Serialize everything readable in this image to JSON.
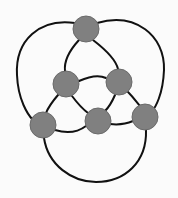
{
  "diagram": {
    "type": "graph",
    "width": 178,
    "height": 198,
    "colors": {
      "background": "#fbfbfb",
      "edge": "#111111",
      "node_fill": "#808080",
      "node_stroke": "#6a6a6a"
    },
    "node_radius": 13,
    "nodes": [
      {
        "id": "top",
        "x": 86,
        "y": 29
      },
      {
        "id": "mid-left",
        "x": 66,
        "y": 84
      },
      {
        "id": "mid-right",
        "x": 119,
        "y": 82
      },
      {
        "id": "bottom-left",
        "x": 43,
        "y": 125
      },
      {
        "id": "bottom-center",
        "x": 98,
        "y": 121
      },
      {
        "id": "bottom-right",
        "x": 145,
        "y": 117
      }
    ],
    "edges": [
      {
        "from": "top",
        "to": "bottom-left",
        "path": "M 75 23 C 40 18, 15 40, 17 75 C 18 100, 28 115, 33 120"
      },
      {
        "from": "top",
        "to": "bottom-right",
        "path": "M 97 23 C 135 12, 165 35, 164 70 C 163 95, 155 108, 152 111"
      },
      {
        "from": "top",
        "to": "mid-left",
        "path": "M 79 40 C 68 52, 64 62, 65 71"
      },
      {
        "from": "top",
        "to": "mid-right",
        "path": "M 93 40 C 106 50, 116 60, 118 69"
      },
      {
        "from": "mid-left",
        "to": "mid-right",
        "path": "M 79 81 C 90 76, 100 75, 106 78"
      },
      {
        "from": "mid-left",
        "to": "bottom-left",
        "path": "M 58 95 C 52 102, 48 108, 46 113"
      },
      {
        "from": "mid-left",
        "to": "bottom-center",
        "path": "M 72 96 C 78 104, 84 110, 88 113"
      },
      {
        "from": "mid-right",
        "to": "bottom-center",
        "path": "M 115 95 C 112 102, 108 108, 105 111"
      },
      {
        "from": "mid-right",
        "to": "bottom-right",
        "path": "M 128 92 C 134 98, 138 104, 140 106"
      },
      {
        "from": "bottom-left",
        "to": "bottom-center",
        "path": "M 55 130 C 68 134, 78 132, 86 126"
      },
      {
        "from": "bottom-center",
        "to": "bottom-right",
        "path": "M 110 124 C 118 125, 126 124, 133 121"
      },
      {
        "from": "bottom-left",
        "to": "bottom-right",
        "path": "M 44 138 C 48 165, 72 182, 96 182 C 125 182, 147 162, 146 130"
      }
    ]
  }
}
